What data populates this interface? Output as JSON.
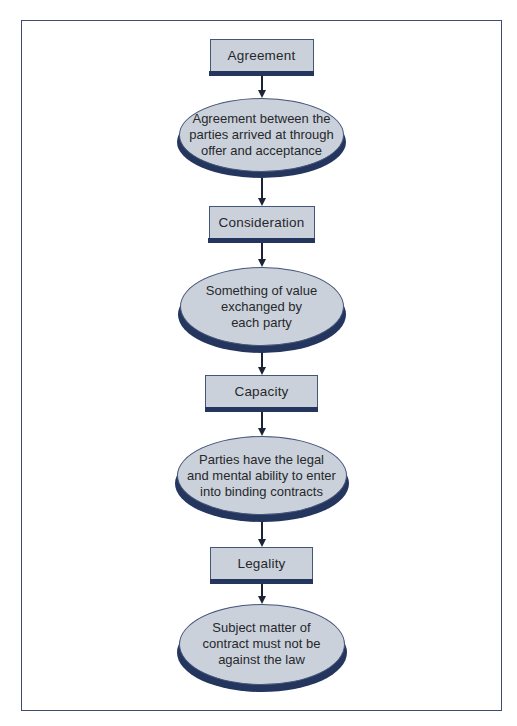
{
  "diagram": {
    "steps": [
      {
        "box_label": "Agreement",
        "ellipse_text": "Agreement between the\nparties arrived at through\noffer and acceptance"
      },
      {
        "box_label": "Consideration",
        "ellipse_text": "Something of value\nexchanged by\neach party"
      },
      {
        "box_label": "Capacity",
        "ellipse_text": "Parties have the legal\nand mental ability to enter\ninto binding contracts"
      },
      {
        "box_label": "Legality",
        "ellipse_text": "Subject matter of\ncontract must not be\nagainst the law"
      }
    ],
    "colors": {
      "fill": "#cbd1da",
      "shadow": "#24365e",
      "outline": "#44557a",
      "arrow": "#1b2334",
      "frame": "#3f4c72",
      "text": "#26282c"
    }
  }
}
